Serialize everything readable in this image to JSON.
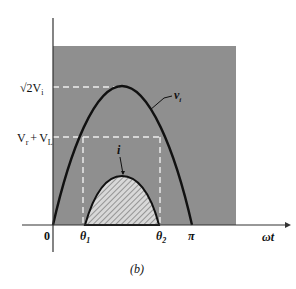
{
  "figure": {
    "caption": "(b)",
    "y_labels": {
      "peak": "√2V",
      "peak_sub": "i",
      "threshold_a": "V",
      "threshold_a_sub": "r",
      "threshold_plus": "+",
      "threshold_b": "V",
      "threshold_b_sub": "L"
    },
    "x_labels": {
      "origin": "0",
      "theta1": "θ",
      "theta1_sub": "1",
      "theta2": "θ",
      "theta2_sub": "2",
      "pi": "π",
      "axis": "ωt"
    },
    "curve_labels": {
      "vi": "v",
      "vi_sub": "i",
      "current": "i"
    },
    "colors": {
      "shaded_region": "#8f8f8f",
      "curve": "#111111",
      "dashed": "#e8e8e8"
    }
  }
}
